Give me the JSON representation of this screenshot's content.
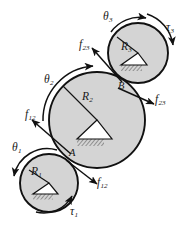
{
  "figure": {
    "kind": "mechanics-free-body-diagram",
    "background_color": "#ffffff",
    "disk_fill_color": "#d4d4d4",
    "outline_color": "#111111",
    "label_color": "#181818"
  },
  "bodies": [
    {
      "id": "disk-1",
      "radius_label": "R",
      "radius_subscript": "1",
      "center_x": 49,
      "center_y": 183,
      "radius": 29
    },
    {
      "id": "disk-2",
      "radius_label": "R",
      "radius_subscript": "2",
      "center_x": 97,
      "center_y": 120,
      "radius": 48
    },
    {
      "id": "disk-3",
      "radius_label": "R",
      "radius_subscript": "3",
      "center_x": 138,
      "center_y": 53,
      "radius": 30
    }
  ],
  "contact_points": [
    {
      "id": "point-a",
      "label": "A",
      "x": 71,
      "y": 154
    },
    {
      "id": "point-b",
      "label": "B",
      "x": 120,
      "y": 87
    }
  ],
  "angles": [
    {
      "id": "theta-1",
      "symbol": "θ",
      "subscript": "1",
      "x": 12,
      "y": 142
    },
    {
      "id": "theta-2",
      "symbol": "θ",
      "subscript": "2",
      "x": 44,
      "y": 74
    },
    {
      "id": "theta-3",
      "symbol": "θ",
      "subscript": "3",
      "x": 103,
      "y": 11
    }
  ],
  "torques": [
    {
      "id": "tau-1",
      "symbol": "τ",
      "subscript": "1",
      "x": 70,
      "y": 206
    },
    {
      "id": "tau-3",
      "symbol": "τ",
      "subscript": "3",
      "x": 166,
      "y": 22
    }
  ],
  "forces": [
    {
      "id": "f12-upper-left",
      "symbol": "f",
      "subscript": "12",
      "x": 25,
      "y": 109
    },
    {
      "id": "f12-lower-right",
      "symbol": "f",
      "subscript": "12",
      "x": 97,
      "y": 177
    },
    {
      "id": "f23-upper-left",
      "symbol": "f",
      "subscript": "23",
      "x": 79,
      "y": 39
    },
    {
      "id": "f23-lower-right",
      "symbol": "f",
      "subscript": "23",
      "x": 155,
      "y": 94
    }
  ]
}
